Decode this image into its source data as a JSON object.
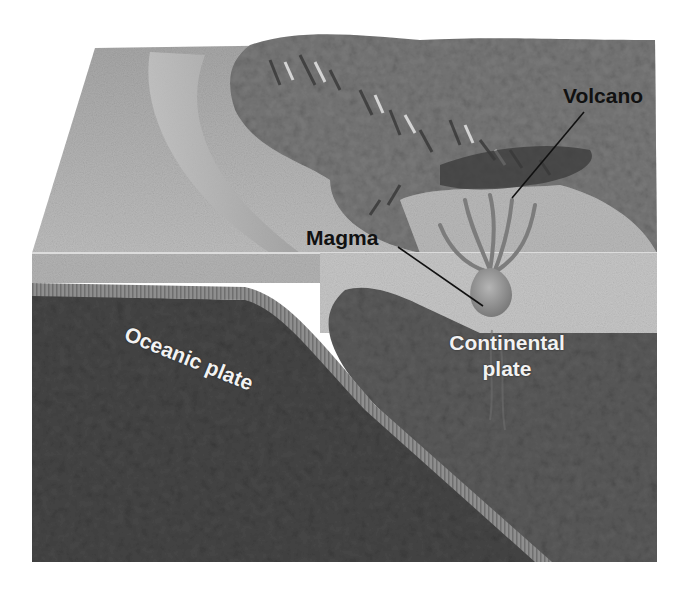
{
  "diagram": {
    "type": "subduction-zone-block-diagram",
    "colors": {
      "background": "#ffffff",
      "ocean_surface": "#a9a9a9",
      "land_surface": "#7d7d7d",
      "oceanic_plate": "#4a4a4a",
      "continental_plate": "#5e5e5e",
      "crust_band": "#8c8c8c",
      "magma": "#9a9a9a",
      "label_dark": "#111111",
      "label_light": "#f2f2f2"
    },
    "labels": {
      "volcano": "Volcano",
      "magma": "Magma",
      "oceanic_plate": "Oceanic plate",
      "continental_plate_line1": "Continental",
      "continental_plate_line2": "plate"
    }
  }
}
